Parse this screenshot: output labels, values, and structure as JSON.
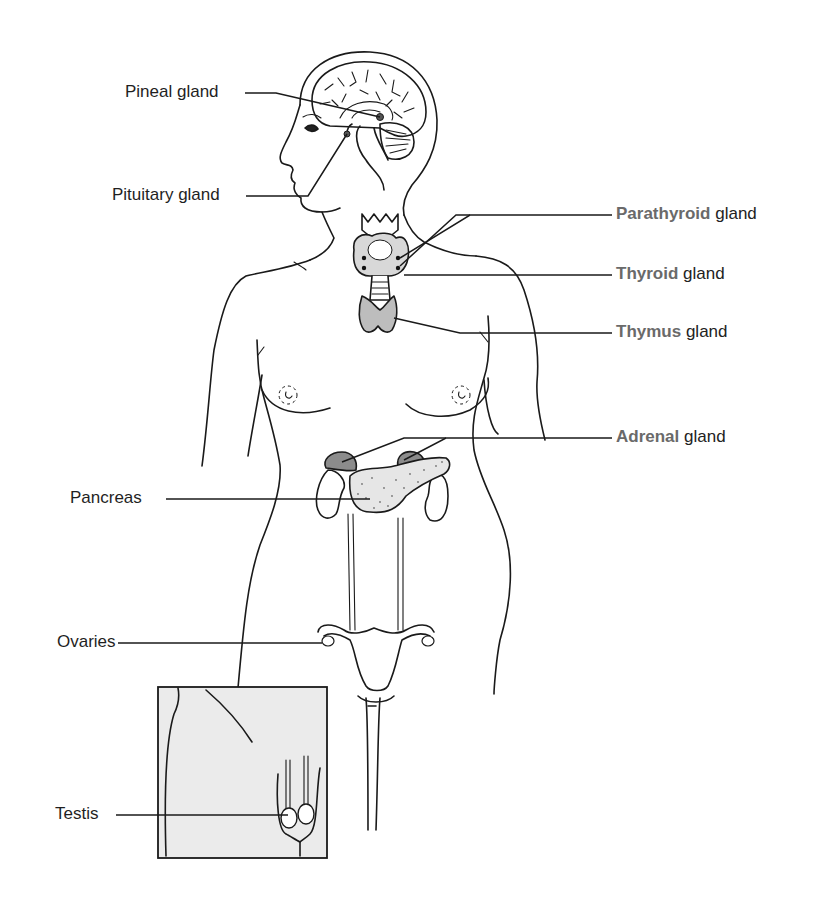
{
  "diagram": {
    "colors": {
      "line": "#1a1a1a",
      "highlight_text": "#6a6a6a",
      "label_text": "#222222",
      "gland_fill_dark": "#8c8c8c",
      "gland_fill_light": "#c8c8c8",
      "pancreas_fill": "#e6e6e6",
      "inset_fill": "#ebebeb"
    },
    "labels_left": [
      {
        "id": "pineal",
        "text": "Pineal gland"
      },
      {
        "id": "pituitary",
        "text": "Pituitary gland"
      },
      {
        "id": "pancreas",
        "text": "Pancreas"
      },
      {
        "id": "ovaries",
        "text": "Ovaries"
      },
      {
        "id": "testis",
        "text": "Testis"
      }
    ],
    "labels_right": [
      {
        "id": "parathyroid",
        "highlight": "Parathyroid",
        "rest": " gland"
      },
      {
        "id": "thyroid",
        "highlight": "Thyroid",
        "rest": " gland"
      },
      {
        "id": "thymus",
        "highlight": "Thymus",
        "rest": " gland"
      },
      {
        "id": "adrenal",
        "highlight": "Adrenal",
        "rest": " gland"
      }
    ],
    "inset": {
      "subject": "male-groin-testis-inset"
    }
  }
}
